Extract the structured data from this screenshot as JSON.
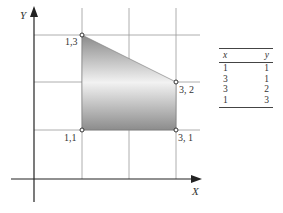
{
  "diagram": {
    "x_axis_label": "X",
    "y_axis_label": "Y",
    "points": [
      {
        "label": "1,1",
        "x": 1,
        "y": 1
      },
      {
        "label": "3, 1",
        "x": 3,
        "y": 1
      },
      {
        "label": "3, 2",
        "x": 3,
        "y": 2
      },
      {
        "label": "1,3",
        "x": 1,
        "y": 3
      }
    ],
    "fill": {
      "type": "gradient",
      "colors": [
        "#8a8a8a",
        "#f4f4f4",
        "#8a8a8a"
      ]
    }
  },
  "table": {
    "headers": [
      "x",
      "y"
    ],
    "rows": [
      [
        "1",
        "1"
      ],
      [
        "3",
        "1"
      ],
      [
        "3",
        "2"
      ],
      [
        "1",
        "3"
      ]
    ]
  }
}
